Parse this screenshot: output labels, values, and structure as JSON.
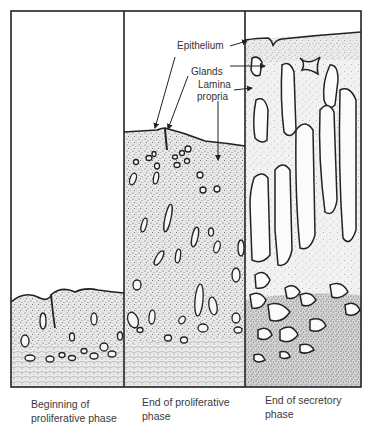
{
  "figure": {
    "type": "histology-illustration",
    "colors": {
      "frame": "#222222",
      "stroma": "#bdbdbd",
      "gland_outline": "#1e1e1e",
      "background": "#ffffff"
    }
  },
  "labels": {
    "epithelium": "Epithelium",
    "glands": "Glands",
    "lamina_propria_line1": "Lamina",
    "lamina_propria_line2": "propria"
  },
  "panels": [
    {
      "id": "beginning-proliferative",
      "caption_line1": "Beginning of",
      "caption_line2": "proliferative phase"
    },
    {
      "id": "end-proliferative",
      "caption_line1": "End of proliferative",
      "caption_line2": "phase"
    },
    {
      "id": "end-secretory",
      "caption_line1": "End of secretory",
      "caption_line2": "phase"
    }
  ]
}
